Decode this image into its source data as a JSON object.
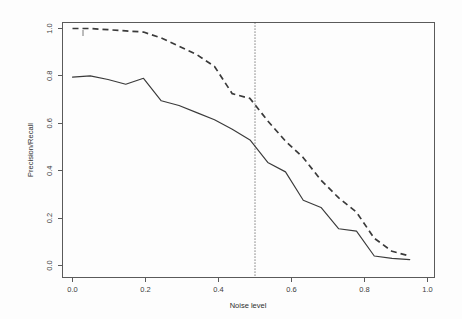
{
  "chart_data": {
    "type": "line",
    "title": "",
    "xlabel": "Noise level",
    "ylabel": "Precision/Recall",
    "xlim": [
      -0.04,
      1.04
    ],
    "ylim": [
      -0.04,
      1.04
    ],
    "grid": false,
    "legend": "none",
    "xticks": [
      "0.0",
      "0.2",
      "0.4",
      "0.6",
      "0.8",
      "1.0"
    ],
    "xtick_values": [
      0.0,
      0.2,
      0.4,
      0.6,
      0.8,
      1.0
    ],
    "yticks": [
      "0.0",
      "0.2",
      "0.4",
      "0.6",
      "0.8",
      "1.0"
    ],
    "ytick_values": [
      0.0,
      0.2,
      0.4,
      0.6,
      0.8,
      1.0
    ],
    "annotations": [
      {
        "name": "threshold-vline",
        "type": "vertical-dotted-line",
        "x": 0.5,
        "label": ""
      }
    ],
    "x": [
      0.0,
      0.05,
      0.1,
      0.15,
      0.2,
      0.25,
      0.3,
      0.35,
      0.4,
      0.45,
      0.5,
      0.55,
      0.6,
      0.65,
      0.7,
      0.75,
      0.8,
      0.85,
      0.9,
      0.95
    ],
    "series": [
      {
        "name": "Recall",
        "style": "dashed",
        "values": [
          1.0,
          1.0,
          0.995,
          0.99,
          0.985,
          0.96,
          0.925,
          0.89,
          0.84,
          0.725,
          0.705,
          0.61,
          0.525,
          0.455,
          0.36,
          0.285,
          0.225,
          0.115,
          0.06,
          0.04
        ]
      },
      {
        "name": "Precision",
        "style": "solid",
        "values": [
          0.795,
          0.8,
          0.785,
          0.765,
          0.79,
          0.695,
          0.675,
          0.645,
          0.615,
          0.575,
          0.53,
          0.435,
          0.395,
          0.275,
          0.245,
          0.155,
          0.145,
          0.04,
          0.03,
          0.025
        ]
      }
    ]
  },
  "axes": {
    "x_title": "Noise level",
    "y_title": "Precision/Recall"
  }
}
